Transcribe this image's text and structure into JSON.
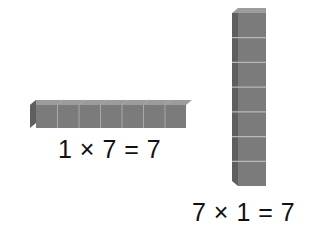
{
  "diagram": {
    "horizontal_rod": {
      "cube_count": 7,
      "orientation": "horizontal",
      "equation": "1 × 7 = 7"
    },
    "vertical_rod": {
      "cube_count": 7,
      "orientation": "vertical",
      "equation": "7 × 1 = 7"
    },
    "colors": {
      "front": "#7a7a7a",
      "side": "#5e5e5e",
      "top": "#9a9a9a",
      "seam": "#b5b5b5",
      "background": "#ffffff",
      "text": "#111111"
    }
  }
}
